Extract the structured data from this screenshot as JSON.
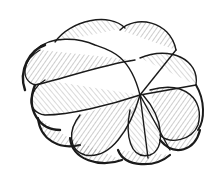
{
  "image": {
    "subject": "hand-drawn sketch of a lobed pumpkin-like object",
    "style": "black ink line drawing with hatching on white",
    "background": "#ffffff",
    "ink": "#1a1a1a",
    "lobes": 9
  }
}
